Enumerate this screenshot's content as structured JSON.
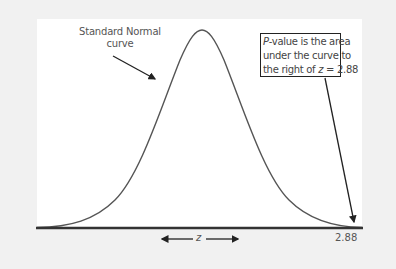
{
  "diagram": {
    "curve_label": [
      "Standard Normal",
      "curve"
    ],
    "callout": {
      "line1_prefix": "P",
      "line1_rest": "-value is the area",
      "line2": "under the curve to",
      "line3_prefix": "the right of ",
      "line3_var": "z",
      "line3_rest": " = 2.88"
    },
    "axis": {
      "variable": "z",
      "tick_label": "2.88"
    },
    "colors": {
      "background": "#f1f1f1",
      "panel": "#ffffff",
      "curve": "#555555",
      "axis": "#333333",
      "arrow": "#222222"
    }
  }
}
